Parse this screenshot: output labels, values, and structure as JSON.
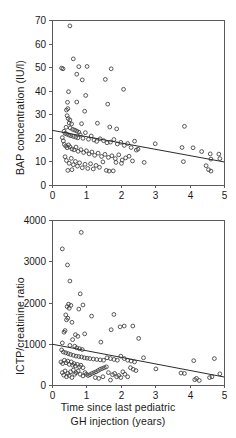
{
  "figure": {
    "x_axis_title_line1": "Time since last pediatric",
    "x_axis_title_line2": "GH injection (years)"
  },
  "chart_data": [
    {
      "type": "scatter",
      "panel": "top",
      "title": "",
      "xlabel": "Time since last pediatric GH injection (years)",
      "ylabel": "BAP concentration (IU/l)",
      "xlim": [
        0,
        5
      ],
      "ylim": [
        0,
        70
      ],
      "xticks": [
        0,
        1,
        2,
        3,
        4,
        5
      ],
      "yticks": [
        0,
        10,
        20,
        30,
        40,
        50,
        60,
        70
      ],
      "grid": false,
      "legend": null,
      "marker": "open-circle",
      "trendline": {
        "x": [
          0,
          5
        ],
        "y": [
          23.2,
          9.8
        ]
      },
      "points": [
        [
          0.52,
          67.5
        ],
        [
          0.28,
          49.6
        ],
        [
          0.32,
          49.3
        ],
        [
          0.62,
          53.5
        ],
        [
          0.78,
          50.2
        ],
        [
          0.72,
          47.0
        ],
        [
          1.02,
          50.3
        ],
        [
          1.72,
          49.3
        ],
        [
          0.88,
          44.6
        ],
        [
          1.55,
          44.8
        ],
        [
          2.08,
          40.6
        ],
        [
          0.98,
          38.0
        ],
        [
          0.48,
          39.6
        ],
        [
          1.62,
          34.3
        ],
        [
          0.45,
          35.1
        ],
        [
          0.72,
          35.2
        ],
        [
          0.42,
          31.8
        ],
        [
          0.46,
          32.4
        ],
        [
          0.95,
          31.3
        ],
        [
          0.44,
          29.4
        ],
        [
          0.47,
          28.2
        ],
        [
          0.52,
          27.6
        ],
        [
          0.5,
          26.3
        ],
        [
          0.57,
          25.9
        ],
        [
          0.86,
          26.0
        ],
        [
          1.32,
          26.2
        ],
        [
          1.68,
          24.6
        ],
        [
          1.88,
          23.8
        ],
        [
          3.85,
          24.9
        ],
        [
          0.41,
          24.5
        ],
        [
          0.53,
          24.2
        ],
        [
          0.6,
          23.6
        ],
        [
          0.66,
          23.3
        ],
        [
          0.72,
          22.9
        ],
        [
          0.78,
          22.4
        ],
        [
          0.35,
          22.8
        ],
        [
          0.38,
          21.9
        ],
        [
          0.43,
          21.6
        ],
        [
          0.49,
          21.2
        ],
        [
          0.55,
          20.9
        ],
        [
          0.62,
          20.6
        ],
        [
          0.69,
          20.3
        ],
        [
          0.75,
          20.0
        ],
        [
          0.82,
          21.3
        ],
        [
          0.9,
          19.8
        ],
        [
          0.97,
          22.2
        ],
        [
          1.06,
          19.4
        ],
        [
          1.14,
          20.8
        ],
        [
          1.22,
          19.1
        ],
        [
          1.3,
          18.5
        ],
        [
          1.4,
          19.6
        ],
        [
          1.5,
          18.8
        ],
        [
          1.6,
          17.9
        ],
        [
          1.7,
          18.2
        ],
        [
          1.8,
          19.3
        ],
        [
          1.9,
          17.4
        ],
        [
          2.0,
          18.1
        ],
        [
          2.1,
          16.8
        ],
        [
          2.2,
          17.6
        ],
        [
          2.3,
          15.9
        ],
        [
          2.4,
          18.6
        ],
        [
          2.45,
          14.8
        ],
        [
          0.3,
          20.1
        ],
        [
          0.33,
          18.7
        ],
        [
          0.36,
          17.2
        ],
        [
          0.4,
          16.5
        ],
        [
          0.44,
          15.8
        ],
        [
          0.48,
          17.0
        ],
        [
          0.52,
          16.2
        ],
        [
          0.58,
          15.3
        ],
        [
          0.64,
          14.9
        ],
        [
          0.7,
          16.1
        ],
        [
          0.76,
          14.3
        ],
        [
          0.84,
          15.0
        ],
        [
          0.92,
          13.8
        ],
        [
          1.0,
          14.5
        ],
        [
          1.08,
          13.2
        ],
        [
          1.16,
          14.0
        ],
        [
          1.24,
          12.6
        ],
        [
          1.34,
          13.5
        ],
        [
          1.44,
          12.1
        ],
        [
          1.54,
          13.0
        ],
        [
          1.64,
          11.7
        ],
        [
          1.74,
          12.4
        ],
        [
          1.84,
          11.2
        ],
        [
          1.94,
          12.8
        ],
        [
          2.04,
          10.6
        ],
        [
          2.14,
          11.5
        ],
        [
          2.24,
          12.2
        ],
        [
          2.34,
          10.2
        ],
        [
          2.5,
          15.2
        ],
        [
          2.68,
          9.6
        ],
        [
          3.0,
          17.5
        ],
        [
          3.78,
          15.9
        ],
        [
          4.1,
          15.8
        ],
        [
          4.35,
          14.2
        ],
        [
          4.6,
          13.2
        ],
        [
          4.85,
          13.1
        ],
        [
          4.62,
          11.0
        ],
        [
          4.88,
          11.2
        ],
        [
          4.48,
          8.2
        ],
        [
          4.55,
          6.5
        ],
        [
          4.62,
          5.9
        ],
        [
          3.82,
          9.9
        ],
        [
          0.38,
          12.0
        ],
        [
          0.42,
          10.4
        ],
        [
          0.5,
          9.2
        ],
        [
          0.56,
          11.3
        ],
        [
          0.62,
          8.6
        ],
        [
          0.68,
          10.0
        ],
        [
          0.74,
          8.0
        ],
        [
          0.8,
          9.4
        ],
        [
          0.88,
          7.3
        ],
        [
          0.96,
          8.8
        ],
        [
          1.04,
          7.0
        ],
        [
          1.12,
          9.0
        ],
        [
          1.2,
          6.8
        ],
        [
          1.28,
          8.3
        ],
        [
          1.38,
          7.5
        ],
        [
          1.48,
          9.8
        ],
        [
          1.58,
          6.2
        ],
        [
          1.66,
          5.9
        ],
        [
          1.78,
          6.0
        ],
        [
          1.86,
          9.6
        ],
        [
          2.02,
          9.2
        ],
        [
          0.46,
          6.2
        ],
        [
          0.58,
          6.5
        ]
      ]
    },
    {
      "type": "scatter",
      "panel": "bottom",
      "title": "",
      "xlabel": "Time since last pediatric GH injection (years)",
      "ylabel": "ICTP/creatinine ratio",
      "xlim": [
        0,
        5
      ],
      "ylim": [
        0,
        4000
      ],
      "xticks": [
        0,
        1,
        2,
        3,
        4,
        5
      ],
      "yticks": [
        0,
        1000,
        2000,
        3000,
        4000
      ],
      "grid": false,
      "legend": null,
      "marker": "open-circle",
      "trendline": {
        "x": [
          0,
          5
        ],
        "y": [
          990,
          195
        ]
      },
      "points": [
        [
          0.85,
          3700
        ],
        [
          0.3,
          3300
        ],
        [
          0.45,
          2910
        ],
        [
          0.52,
          2520
        ],
        [
          0.82,
          2210
        ],
        [
          0.48,
          1960
        ],
        [
          0.55,
          1930
        ],
        [
          0.9,
          1940
        ],
        [
          0.44,
          1900
        ],
        [
          0.5,
          1860
        ],
        [
          0.78,
          1840
        ],
        [
          0.4,
          1700
        ],
        [
          0.46,
          1620
        ],
        [
          0.42,
          1580
        ],
        [
          0.58,
          1520
        ],
        [
          1.15,
          1670
        ],
        [
          1.8,
          1710
        ],
        [
          2.1,
          1430
        ],
        [
          2.35,
          1430
        ],
        [
          1.72,
          1340
        ],
        [
          1.98,
          1410
        ],
        [
          2.52,
          1130
        ],
        [
          0.38,
          1320
        ],
        [
          0.35,
          1280
        ],
        [
          0.68,
          1220
        ],
        [
          0.75,
          1180
        ],
        [
          0.95,
          1240
        ],
        [
          1.42,
          1040
        ],
        [
          0.6,
          1100
        ],
        [
          0.3,
          1020
        ],
        [
          0.52,
          960
        ],
        [
          0.66,
          940
        ],
        [
          0.72,
          900
        ],
        [
          0.8,
          880
        ],
        [
          0.88,
          860
        ],
        [
          0.28,
          850
        ],
        [
          0.33,
          800
        ],
        [
          0.4,
          780
        ],
        [
          0.47,
          760
        ],
        [
          0.54,
          740
        ],
        [
          0.62,
          720
        ],
        [
          0.7,
          700
        ],
        [
          0.78,
          690
        ],
        [
          0.86,
          680
        ],
        [
          0.94,
          660
        ],
        [
          1.02,
          650
        ],
        [
          1.1,
          640
        ],
        [
          1.2,
          630
        ],
        [
          1.3,
          620
        ],
        [
          1.4,
          610
        ],
        [
          1.5,
          600
        ],
        [
          1.6,
          660
        ],
        [
          1.7,
          640
        ],
        [
          1.8,
          620
        ],
        [
          1.9,
          600
        ],
        [
          2.0,
          700
        ],
        [
          2.1,
          640
        ],
        [
          2.2,
          600
        ],
        [
          2.3,
          580
        ],
        [
          2.4,
          560
        ],
        [
          0.26,
          560
        ],
        [
          0.31,
          520
        ],
        [
          0.36,
          600
        ],
        [
          0.41,
          540
        ],
        [
          0.46,
          580
        ],
        [
          0.5,
          500
        ],
        [
          0.56,
          560
        ],
        [
          0.6,
          480
        ],
        [
          0.64,
          520
        ],
        [
          0.68,
          460
        ],
        [
          0.74,
          500
        ],
        [
          0.8,
          440
        ],
        [
          0.84,
          480
        ],
        [
          0.9,
          420
        ],
        [
          0.96,
          300
        ],
        [
          1.0,
          260
        ],
        [
          1.05,
          230
        ],
        [
          1.1,
          250
        ],
        [
          1.16,
          280
        ],
        [
          1.22,
          300
        ],
        [
          1.28,
          320
        ],
        [
          1.34,
          350
        ],
        [
          1.4,
          380
        ],
        [
          1.46,
          400
        ],
        [
          1.52,
          420
        ],
        [
          1.58,
          440
        ],
        [
          1.64,
          300
        ],
        [
          1.7,
          120
        ],
        [
          1.76,
          250
        ],
        [
          1.82,
          280
        ],
        [
          1.88,
          200
        ],
        [
          1.94,
          230
        ],
        [
          2.0,
          180
        ],
        [
          2.06,
          320
        ],
        [
          2.12,
          260
        ],
        [
          2.2,
          200
        ],
        [
          2.28,
          420
        ],
        [
          2.36,
          380
        ],
        [
          2.44,
          350
        ],
        [
          2.66,
          660
        ],
        [
          3.02,
          390
        ],
        [
          3.75,
          290
        ],
        [
          3.85,
          280
        ],
        [
          4.12,
          590
        ],
        [
          4.15,
          130
        ],
        [
          4.2,
          160
        ],
        [
          4.28,
          110
        ],
        [
          4.58,
          180
        ],
        [
          4.65,
          200
        ],
        [
          4.72,
          640
        ],
        [
          4.88,
          270
        ],
        [
          0.34,
          240
        ],
        [
          0.42,
          200
        ],
        [
          0.5,
          230
        ],
        [
          0.58,
          180
        ],
        [
          0.66,
          260
        ],
        [
          0.3,
          300
        ],
        [
          0.38,
          340
        ],
        [
          0.46,
          280
        ],
        [
          0.54,
          320
        ],
        [
          0.62,
          360
        ],
        [
          0.7,
          300
        ],
        [
          0.76,
          340
        ],
        [
          0.82,
          260
        ],
        [
          0.9,
          220
        ],
        [
          1.26,
          180
        ],
        [
          1.36,
          160
        ],
        [
          1.48,
          200
        ]
      ]
    }
  ]
}
